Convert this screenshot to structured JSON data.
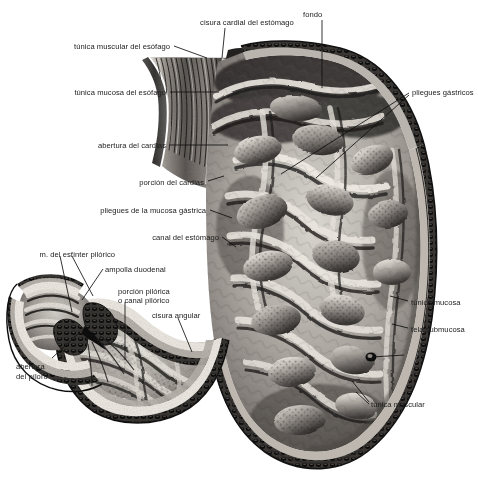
{
  "figure": {
    "kind": "anatomical-illustration",
    "language": "es",
    "background_color": "#ffffff",
    "label_color": "#1b1b1b",
    "leader_color": "#111111"
  },
  "labels": [
    {
      "id": "cisura-cardial",
      "text": "cisura cardial del estómago",
      "align": "center",
      "x": 186,
      "y": 18,
      "w": 122
    },
    {
      "id": "fondo",
      "text": "fondo",
      "align": "left",
      "x": 303,
      "y": 10,
      "w": 40
    },
    {
      "id": "tunica-muscular-esof",
      "text": "túnica muscular del esófago",
      "align": "right",
      "x": 40,
      "y": 42,
      "w": 130
    },
    {
      "id": "tunica-mucosa-esof",
      "text": "túnica mucosa del esófago",
      "align": "right",
      "x": 38,
      "y": 88,
      "w": 128
    },
    {
      "id": "pliegues-gastricos",
      "text": "pliegues gástricos",
      "align": "left",
      "x": 412,
      "y": 88,
      "w": 70
    },
    {
      "id": "abertura-cardias",
      "text": "abertura del cardias",
      "align": "right",
      "x": 72,
      "y": 141,
      "w": 94
    },
    {
      "id": "porcion-cardias",
      "text": "porción del cardias",
      "align": "right",
      "x": 110,
      "y": 178,
      "w": 94
    },
    {
      "id": "pliegues-mucosa-gastr",
      "text": "pliegues de la mucosa gástrica",
      "align": "right",
      "x": 82,
      "y": 206,
      "w": 124
    },
    {
      "id": "canal-estomago",
      "text": "canal del estómago",
      "align": "right",
      "x": 133,
      "y": 233,
      "w": 86
    },
    {
      "id": "m-esfinter-pilorico",
      "text": "m. del esfínter pilórico",
      "align": "right",
      "x": 25,
      "y": 250,
      "w": 90
    },
    {
      "id": "ampolla-duodenal",
      "text": "ampolla duodenal",
      "align": "left",
      "x": 105,
      "y": 265,
      "w": 74
    },
    {
      "id": "porcion-pilorica",
      "text": "porción pilórica",
      "align": "left",
      "x": 118,
      "y": 287,
      "w": 64
    },
    {
      "id": "canal-pilorico",
      "text": "o canal pilórico",
      "align": "left",
      "x": 118,
      "y": 296,
      "w": 64
    },
    {
      "id": "cisura-angular",
      "text": "cisura angular",
      "align": "left",
      "x": 152,
      "y": 311,
      "w": 58
    },
    {
      "id": "tunica-mucosa",
      "text": "túnica mucosa",
      "align": "left",
      "x": 411,
      "y": 298,
      "w": 60
    },
    {
      "id": "tela-submucosa",
      "text": "tela submucosa",
      "align": "left",
      "x": 411,
      "y": 325,
      "w": 62
    },
    {
      "id": "abertura-piloro-1",
      "text": "abertura",
      "align": "left",
      "x": 16,
      "y": 362,
      "w": 44
    },
    {
      "id": "abertura-piloro-2",
      "text": "del píloro",
      "align": "left",
      "x": 16,
      "y": 372,
      "w": 44
    },
    {
      "id": "tunica-muscular",
      "text": "túnica muscular",
      "align": "left",
      "x": 371,
      "y": 400,
      "w": 64
    }
  ],
  "leaders": [
    {
      "id": "leader-cisura-cardial",
      "points": "225,28 222,58"
    },
    {
      "id": "leader-fondo",
      "points": "322,20 322,88"
    },
    {
      "id": "leader-tunica-muscular-esof",
      "points": "174,46 207,58"
    },
    {
      "id": "leader-tunica-mucosa-esof",
      "points": "170,92 219,92"
    },
    {
      "id": "leader-pliegues-gastricos-a",
      "points": "409,93 281,174"
    },
    {
      "id": "leader-pliegues-gastricos-b",
      "points": "409,95 316,178"
    },
    {
      "id": "leader-abertura-cardias",
      "points": "170,145 228,145"
    },
    {
      "id": "leader-porcion-cardias",
      "points": "208,181 224,176"
    },
    {
      "id": "leader-pliegues-mucosa",
      "points": "210,210 232,218"
    },
    {
      "id": "leader-canal-estomago",
      "points": "222,237 236,247"
    },
    {
      "id": "leader-m-esfinter-a",
      "points": "60,256 72,312"
    },
    {
      "id": "leader-m-esfinter-b",
      "points": "72,256 93,296"
    },
    {
      "id": "leader-ampolla-duodenal",
      "points": "103,269 82,300"
    },
    {
      "id": "leader-porcion-pilorica",
      "points": "125,302 125,360"
    },
    {
      "id": "leader-cisura-angular",
      "points": "178,318 192,352"
    },
    {
      "id": "leader-tunica-mucosa",
      "points": "408,301 390,296"
    },
    {
      "id": "leader-tela-submucosa",
      "points": "408,328 392,324"
    },
    {
      "id": "leader-vessel",
      "points": "404,355 372,357"
    },
    {
      "id": "leader-abertura-piloro",
      "points": "52,358 80,332"
    },
    {
      "id": "leader-tunica-muscular-a",
      "points": "369,402 352,381"
    },
    {
      "id": "leader-tunica-muscular-b",
      "points": "369,404 356,392"
    }
  ]
}
